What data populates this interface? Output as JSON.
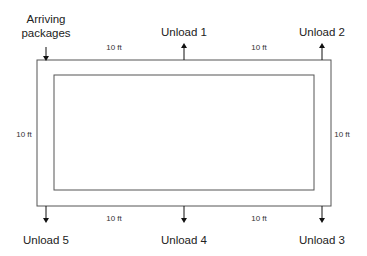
{
  "diagram": {
    "title": "",
    "colors": {
      "stroke": "#555555",
      "arrow": "#111111",
      "text": "#222222",
      "background": "#ffffff"
    },
    "outer_rect": {
      "x": 37,
      "y": 60,
      "w": 294,
      "h": 146
    },
    "inner_rect": {
      "x": 54,
      "y": 75,
      "w": 260,
      "h": 115
    },
    "labels": {
      "arriving": [
        "Arriving",
        "packages"
      ],
      "unload1": "Unload 1",
      "unload2": "Unload 2",
      "unload3": "Unload 3",
      "unload4": "Unload 4",
      "unload5": "Unload 5"
    },
    "dimensions": {
      "top_left": "10 ft",
      "top_right": "10 ft",
      "bottom_left": "10 ft",
      "bottom_right": "10 ft",
      "left": "10 ft",
      "right": "10 ft"
    },
    "arrows": [
      {
        "name": "arriving-packages",
        "direction": "in",
        "x": 46
      },
      {
        "name": "unload-1",
        "direction": "out-up",
        "x": 184
      },
      {
        "name": "unload-2",
        "direction": "out-up",
        "x": 322
      },
      {
        "name": "unload-3",
        "direction": "out-down",
        "x": 322
      },
      {
        "name": "unload-4",
        "direction": "out-down",
        "x": 184
      },
      {
        "name": "unload-5",
        "direction": "out-down",
        "x": 46
      }
    ]
  }
}
